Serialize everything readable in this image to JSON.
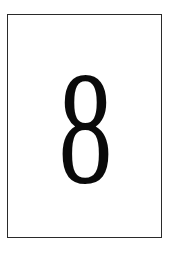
{
  "card": {
    "digit": "8",
    "border_color": "#2a2a2a",
    "text_color": "#0a0a0a",
    "background_color": "#ffffff"
  }
}
